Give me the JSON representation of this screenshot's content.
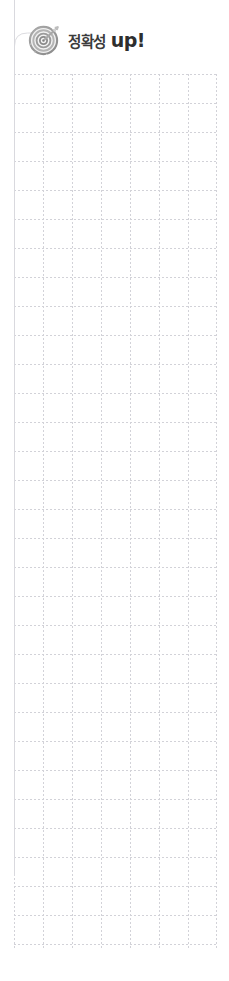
{
  "page": {
    "background_color": "#ffffff",
    "width": 229,
    "height": 981
  },
  "header": {
    "icon": "target-dartboard-icon",
    "title_korean": "정확성",
    "title_english": "up!",
    "title_full": "정확성 up!",
    "text_color": "#3b3b3b",
    "accent_color": "#2e2e2e",
    "icon_color": "#9a9a9a"
  },
  "grid": {
    "name": "dotted-worksheet-grid",
    "line_color": "#d2d2d8",
    "border_color": "#d9d9de",
    "left": 14,
    "top": 74,
    "width": 203,
    "height": 876,
    "cell_size": 29,
    "columns": 7,
    "rows": 30,
    "line_style": "dotted"
  },
  "decoration": {
    "corner_rule": "rounded-corner-connector",
    "corner_rule_color": "#dcdce0"
  }
}
